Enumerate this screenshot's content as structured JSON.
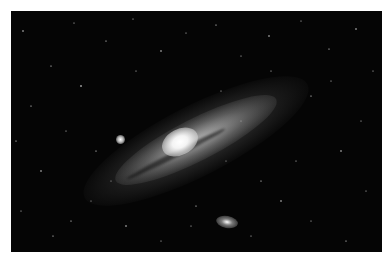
{
  "image": {
    "subject": "Andromeda galaxy",
    "description": "Spiral galaxy with bright core, tilted disk and two satellite galaxies against a star field",
    "background_color": "#050505",
    "border_color": "#ffffff"
  }
}
